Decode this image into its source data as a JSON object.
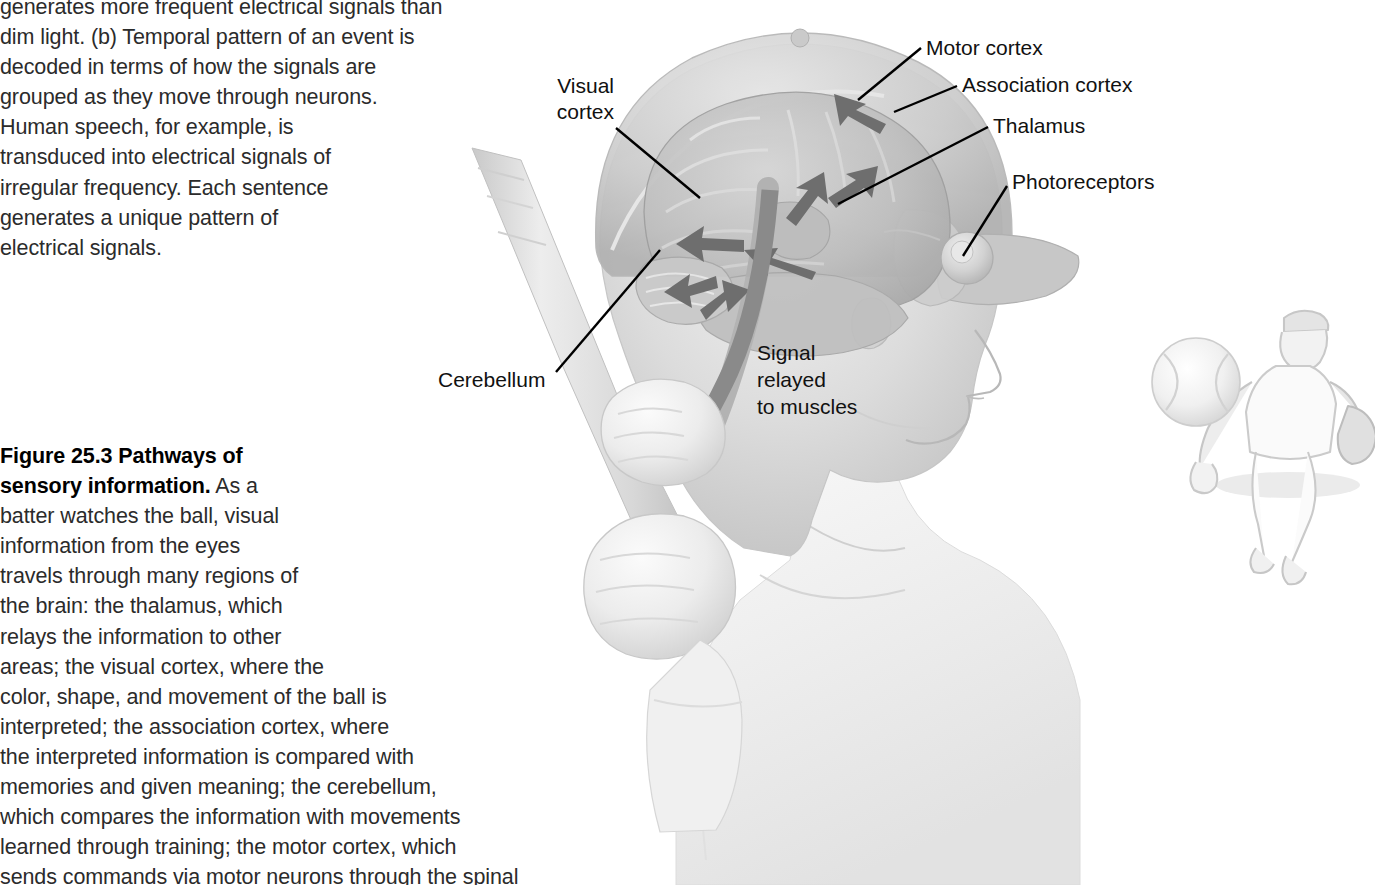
{
  "page": {
    "background_color": "#ffffff",
    "text_color": "#2b2b2b"
  },
  "intro_paragraph": {
    "text": "generates more frequent electrical signals than\ndim light. (b) Temporal pattern of an event is\ndecoded in terms of how the signals are\ngrouped as they move through neurons.\nHuman speech, for example, is\ntransduced into electrical signals of\nirregular frequency. Each sentence\ngenerates a unique pattern of\nelectrical signals."
  },
  "caption": {
    "figure_label": "Figure 25.3",
    "title": "Pathways of sensory information.",
    "bold_run": "Figure 25.3  Pathways of\nsensory information.",
    "body": " As a\nbatter watches the ball, visual\ninformation from the eyes\ntravels through many regions of\nthe brain: the thalamus, which\nrelays the information to other\nareas; the visual cortex, where the\ncolor, shape, and movement of the ball is\ninterpreted; the association cortex, where\nthe interpreted information is compared with\nmemories and given meaning; the cerebellum,\nwhich compares the information with movements\nlearned through training; the motor cortex, which\nsends commands via motor neurons through the spinal"
  },
  "labels": {
    "visual_cortex": "Visual\ncortex",
    "motor_cortex": "Motor cortex",
    "association_cortex": "Association cortex",
    "thalamus": "Thalamus",
    "photoreceptors": "Photoreceptors",
    "cerebellum": "Cerebellum",
    "signal_relayed": "Signal\nrelayed\nto muscles"
  },
  "illustration": {
    "description": "Grayscale airbrush illustration of a baseball batter's head in profile facing right, wearing a helmet, with the brain rendered semi-transparently inside the skull. Gray arrows trace the sensory pathway between brain regions and a large curved gray arrow sweeps down the brainstem toward the muscles. The batter's two fists grip a bat at lower left. A light pencil sketch of a pitcher and a baseball appears at far right.",
    "arrow_color": "#6e6e6e",
    "leader_line_color": "#000000",
    "skin_tone": "#d8d8d8",
    "brain_tone": "#c4c4c4",
    "helmet_tone": "#cfcfcf",
    "sketch_tone": "#d9d9d9"
  }
}
